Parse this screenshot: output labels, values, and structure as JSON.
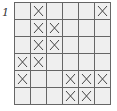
{
  "label": "1",
  "grid": {
    "rows": 6,
    "cols": 6,
    "cells": [
      [
        0,
        1,
        0,
        0,
        0,
        1
      ],
      [
        0,
        1,
        1,
        0,
        0,
        0
      ],
      [
        0,
        1,
        1,
        0,
        0,
        0
      ],
      [
        1,
        1,
        0,
        0,
        0,
        0
      ],
      [
        1,
        0,
        0,
        1,
        1,
        1
      ],
      [
        0,
        0,
        0,
        1,
        1,
        0
      ]
    ],
    "mark": "x-mark"
  },
  "colors": {
    "cell_bg": "#efefef",
    "line": "#666666",
    "mark": "#444444"
  }
}
